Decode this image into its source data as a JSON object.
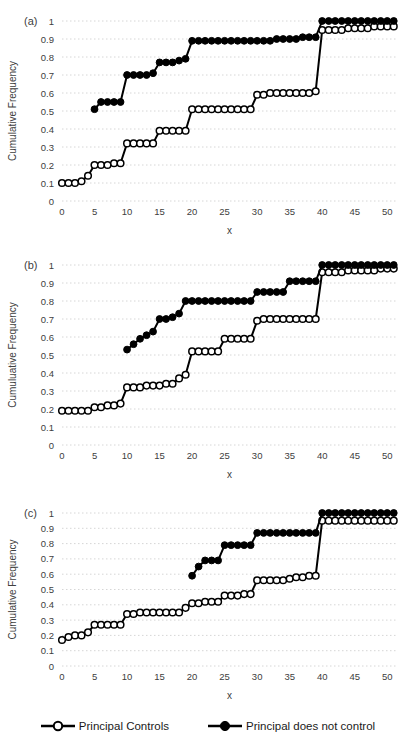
{
  "style": {
    "background": "#ffffff",
    "series_color": "#000000",
    "grid_color": "#d6d6d6",
    "text_color": "#404040"
  },
  "legend": {
    "items": [
      {
        "label": "Principal Controls",
        "marker": "open-circle"
      },
      {
        "label": "Principal does not control",
        "marker": "filled-circle"
      }
    ]
  },
  "chart_data": [
    {
      "type": "line",
      "panel_label": "(a)",
      "xlabel": "x",
      "ylabel": "Cumulative Frequency",
      "xlim": [
        0,
        51.5
      ],
      "ylim": [
        0,
        1
      ],
      "xticks": [
        0,
        5,
        10,
        15,
        20,
        25,
        30,
        35,
        40,
        45,
        50
      ],
      "xtick_labels": [
        "0",
        "5",
        "10",
        "15",
        "20",
        "25",
        "30",
        "35",
        "40",
        "45",
        "50"
      ],
      "yticks": [
        0,
        0.1,
        0.2,
        0.3,
        0.4,
        0.5,
        0.6,
        0.7,
        0.8,
        0.9,
        1
      ],
      "ytick_labels": [
        "0",
        "0.1",
        "0.2",
        "0.3",
        "0.4",
        "0.5",
        "0.6",
        "0.7",
        "0.8",
        "0.9",
        "1"
      ],
      "grid": "horizontal-dotted",
      "legend_position": "bottom-shared",
      "series": [
        {
          "name": "Principal Controls",
          "marker": "open-circle",
          "x": [
            0,
            1,
            2,
            3,
            4,
            5,
            6,
            7,
            8,
            9,
            10,
            11,
            12,
            13,
            14,
            15,
            16,
            17,
            18,
            19,
            20,
            21,
            22,
            23,
            24,
            25,
            26,
            27,
            28,
            29,
            30,
            31,
            32,
            33,
            34,
            35,
            36,
            37,
            38,
            39,
            40,
            41,
            42,
            43,
            44,
            45,
            46,
            47,
            48,
            49,
            50,
            51
          ],
          "y": [
            0.1,
            0.1,
            0.1,
            0.11,
            0.14,
            0.2,
            0.2,
            0.2,
            0.21,
            0.21,
            0.32,
            0.32,
            0.32,
            0.32,
            0.32,
            0.39,
            0.39,
            0.39,
            0.39,
            0.39,
            0.51,
            0.51,
            0.51,
            0.51,
            0.51,
            0.51,
            0.51,
            0.51,
            0.51,
            0.51,
            0.59,
            0.59,
            0.6,
            0.6,
            0.6,
            0.6,
            0.6,
            0.6,
            0.6,
            0.61,
            0.95,
            0.95,
            0.95,
            0.95,
            0.96,
            0.96,
            0.96,
            0.96,
            0.97,
            0.97,
            0.97,
            0.97
          ]
        },
        {
          "name": "Principal does not control",
          "marker": "filled-circle",
          "x": [
            5,
            6,
            7,
            8,
            9,
            10,
            11,
            12,
            13,
            14,
            15,
            16,
            17,
            18,
            19,
            20,
            21,
            22,
            23,
            24,
            25,
            26,
            27,
            28,
            29,
            30,
            31,
            32,
            33,
            34,
            35,
            36,
            37,
            38,
            39,
            40,
            41,
            42,
            43,
            44,
            45,
            46,
            47,
            48,
            49,
            50,
            51
          ],
          "y": [
            0.51,
            0.55,
            0.55,
            0.55,
            0.55,
            0.7,
            0.7,
            0.7,
            0.7,
            0.71,
            0.77,
            0.77,
            0.77,
            0.78,
            0.79,
            0.89,
            0.89,
            0.89,
            0.89,
            0.89,
            0.89,
            0.89,
            0.89,
            0.89,
            0.89,
            0.89,
            0.89,
            0.89,
            0.9,
            0.9,
            0.9,
            0.9,
            0.91,
            0.91,
            0.91,
            1,
            1,
            1,
            1,
            1,
            1,
            1,
            1,
            1,
            1,
            1,
            1
          ]
        }
      ]
    },
    {
      "type": "line",
      "panel_label": "(b)",
      "xlabel": "x",
      "ylabel": "Cumuluative Frequency",
      "xlim": [
        0,
        51.5
      ],
      "ylim": [
        0,
        1
      ],
      "xticks": [
        0,
        5,
        10,
        15,
        20,
        25,
        30,
        35,
        40,
        45,
        50
      ],
      "xtick_labels": [
        "0",
        "5",
        "10",
        "15",
        "20",
        "25",
        "30",
        "35",
        "40",
        "45",
        "50"
      ],
      "yticks": [
        0,
        0.1,
        0.2,
        0.3,
        0.4,
        0.5,
        0.6,
        0.7,
        0.8,
        0.9,
        1
      ],
      "ytick_labels": [
        "0",
        "0.1",
        "0.2",
        "0.3",
        "0.4",
        "0.5",
        "0.6",
        "0.7",
        "0.8",
        "0.9",
        "1"
      ],
      "grid": "horizontal-dotted",
      "legend_position": "bottom-shared",
      "series": [
        {
          "name": "Principal Controls",
          "marker": "open-circle",
          "x": [
            0,
            1,
            2,
            3,
            4,
            5,
            6,
            7,
            8,
            9,
            10,
            11,
            12,
            13,
            14,
            15,
            16,
            17,
            18,
            19,
            20,
            21,
            22,
            23,
            24,
            25,
            26,
            27,
            28,
            29,
            30,
            31,
            32,
            33,
            34,
            35,
            36,
            37,
            38,
            39,
            40,
            41,
            42,
            43,
            44,
            45,
            46,
            47,
            48,
            49,
            50,
            51
          ],
          "y": [
            0.19,
            0.19,
            0.19,
            0.19,
            0.19,
            0.21,
            0.21,
            0.22,
            0.22,
            0.23,
            0.32,
            0.32,
            0.32,
            0.33,
            0.33,
            0.33,
            0.34,
            0.34,
            0.37,
            0.39,
            0.52,
            0.52,
            0.52,
            0.52,
            0.52,
            0.59,
            0.59,
            0.59,
            0.59,
            0.59,
            0.69,
            0.7,
            0.7,
            0.7,
            0.7,
            0.7,
            0.7,
            0.7,
            0.7,
            0.7,
            0.96,
            0.96,
            0.96,
            0.96,
            0.97,
            0.97,
            0.97,
            0.97,
            0.97,
            0.98,
            0.98,
            0.98
          ]
        },
        {
          "name": "Principal does not control",
          "marker": "filled-circle",
          "x": [
            10,
            11,
            12,
            13,
            14,
            15,
            16,
            17,
            18,
            19,
            20,
            21,
            22,
            23,
            24,
            25,
            26,
            27,
            28,
            29,
            30,
            31,
            32,
            33,
            34,
            35,
            36,
            37,
            38,
            39,
            40,
            41,
            42,
            43,
            44,
            45,
            46,
            47,
            48,
            49,
            50,
            51
          ],
          "y": [
            0.53,
            0.56,
            0.59,
            0.61,
            0.63,
            0.7,
            0.7,
            0.71,
            0.73,
            0.8,
            0.8,
            0.8,
            0.8,
            0.8,
            0.8,
            0.8,
            0.8,
            0.8,
            0.8,
            0.8,
            0.85,
            0.85,
            0.85,
            0.85,
            0.85,
            0.91,
            0.91,
            0.91,
            0.91,
            0.91,
            1,
            1,
            1,
            1,
            1,
            1,
            1,
            1,
            1,
            1,
            1,
            1
          ]
        }
      ]
    },
    {
      "type": "line",
      "panel_label": "(c)",
      "xlabel": "x",
      "ylabel": "Cumulative Frequency",
      "xlim": [
        0,
        51.5
      ],
      "ylim": [
        0,
        1
      ],
      "xticks": [
        0,
        5,
        10,
        15,
        20,
        25,
        30,
        35,
        40,
        45,
        50
      ],
      "xtick_labels": [
        "0",
        "5",
        "10",
        "15",
        "20",
        "25",
        "30",
        "35",
        "40",
        "45",
        "50"
      ],
      "yticks": [
        0,
        0.1,
        0.2,
        0.3,
        0.4,
        0.5,
        0.6,
        0.7,
        0.8,
        0.9,
        1
      ],
      "ytick_labels": [
        "0",
        "0.1",
        "0.2",
        "0.3",
        "0.4",
        "0.5",
        "0.6",
        "0.7",
        "0.8",
        "0.9",
        "1"
      ],
      "grid": "horizontal-dotted",
      "legend_position": "bottom-shared",
      "series": [
        {
          "name": "Principal Controls",
          "marker": "open-circle",
          "x": [
            0,
            1,
            2,
            3,
            4,
            5,
            6,
            7,
            8,
            9,
            10,
            11,
            12,
            13,
            14,
            15,
            16,
            17,
            18,
            19,
            20,
            21,
            22,
            23,
            24,
            25,
            26,
            27,
            28,
            29,
            30,
            31,
            32,
            33,
            34,
            35,
            36,
            37,
            38,
            39,
            40,
            41,
            42,
            43,
            44,
            45,
            46,
            47,
            48,
            49,
            50,
            51
          ],
          "y": [
            0.17,
            0.19,
            0.2,
            0.2,
            0.22,
            0.27,
            0.27,
            0.27,
            0.27,
            0.27,
            0.34,
            0.34,
            0.35,
            0.35,
            0.35,
            0.35,
            0.35,
            0.35,
            0.35,
            0.38,
            0.41,
            0.41,
            0.42,
            0.42,
            0.42,
            0.46,
            0.46,
            0.46,
            0.47,
            0.47,
            0.56,
            0.56,
            0.56,
            0.56,
            0.56,
            0.57,
            0.58,
            0.58,
            0.59,
            0.59,
            0.95,
            0.95,
            0.95,
            0.95,
            0.95,
            0.95,
            0.95,
            0.95,
            0.95,
            0.95,
            0.95,
            0.95
          ]
        },
        {
          "name": "Principal does not control",
          "marker": "filled-circle",
          "x": [
            20,
            21,
            22,
            23,
            24,
            25,
            26,
            27,
            28,
            29,
            30,
            31,
            32,
            33,
            34,
            35,
            36,
            37,
            38,
            39,
            40,
            41,
            42,
            43,
            44,
            45,
            46,
            47,
            48,
            49,
            50,
            51
          ],
          "y": [
            0.59,
            0.65,
            0.69,
            0.69,
            0.69,
            0.79,
            0.79,
            0.79,
            0.79,
            0.79,
            0.87,
            0.87,
            0.87,
            0.87,
            0.87,
            0.87,
            0.87,
            0.87,
            0.87,
            0.87,
            1,
            1,
            1,
            1,
            1,
            1,
            1,
            1,
            1,
            1,
            1,
            1
          ]
        }
      ]
    }
  ]
}
